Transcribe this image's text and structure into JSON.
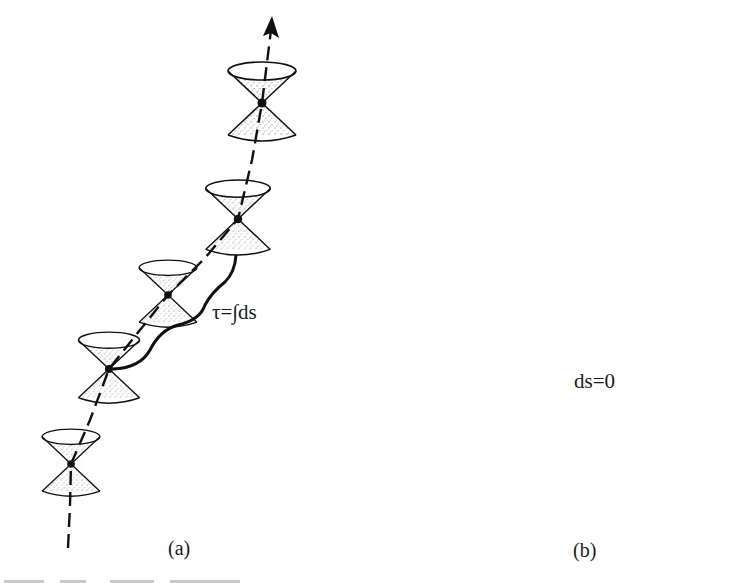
{
  "figure": {
    "panels": [
      {
        "id": "a",
        "label": "(a)",
        "annotation": "τ=∫ds",
        "description": "Timelike world line with light cones at points along it; dashed world line inside cones ending in arrow; brace indicating proper time",
        "cone_count": 6
      },
      {
        "id": "b",
        "label": "(b)",
        "annotation": "ds=0",
        "description": "Null world line running along edges of light cones, arrow at top right; brace indicating zero interval",
        "cone_count": 3
      }
    ],
    "colors": {
      "ink": "#111111",
      "background": "#ffffff",
      "stipple": "#333333"
    }
  }
}
